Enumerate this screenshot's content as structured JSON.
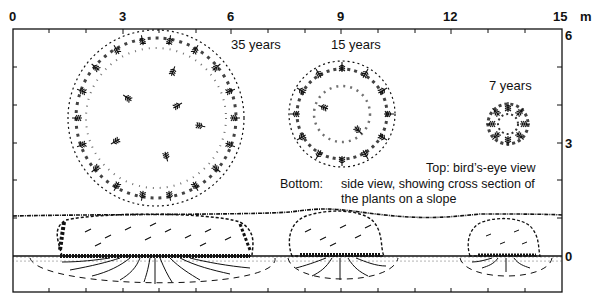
{
  "diagram": {
    "top_axis": {
      "ticks": [
        "0",
        "3",
        "6",
        "9",
        "12",
        "15"
      ],
      "unit": "m"
    },
    "right_axis": {
      "ticks": [
        "6",
        "3",
        "0"
      ]
    },
    "plants": [
      {
        "label": "35 years",
        "top_view": "large circular crown, ~5 m diameter",
        "side_view": "wide low mound with deep spreading roots"
      },
      {
        "label": "15 years",
        "top_view": "medium circular crown, ~3 m diameter",
        "side_view": "medium mound with roots"
      },
      {
        "label": "7 years",
        "top_view": "small crown, ~1.3 m diameter",
        "side_view": "small mound with shallow roots"
      }
    ],
    "caption": {
      "top_label": "Top: bird’s-eye view",
      "bottom_prefix": "Bottom:",
      "bottom_line1": "side view, showing cross section of",
      "bottom_line2": "the plants on a slope"
    },
    "colors": {
      "ink": "#111111",
      "background": "#ffffff"
    }
  }
}
